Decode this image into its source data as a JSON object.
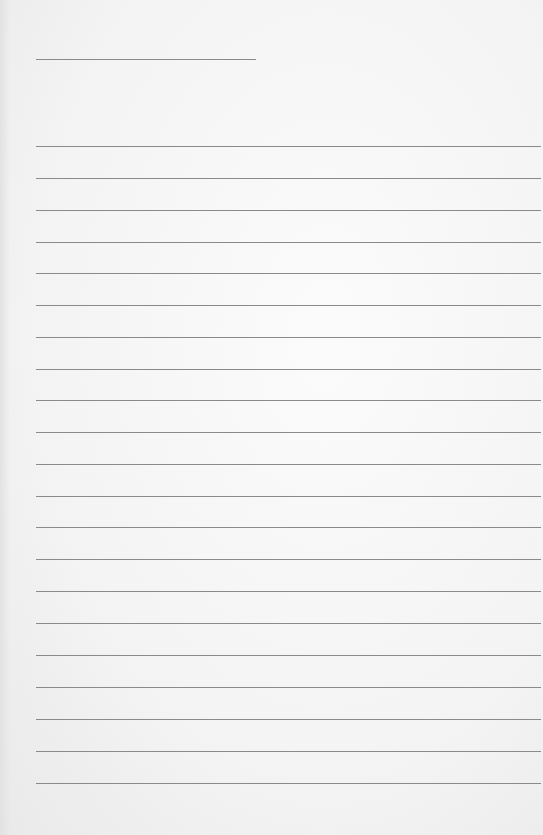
{
  "page": {
    "type": "blank-lined-paper",
    "title_line": {
      "top": 59,
      "left": 36,
      "width": 220
    },
    "lines": [
      146,
      178,
      210,
      242,
      273,
      305,
      337,
      369,
      400,
      432,
      464,
      496,
      527,
      559,
      591,
      623,
      655,
      687,
      719,
      751,
      783
    ],
    "line_color": "#8a8a8a",
    "paper_color": "#f4f4f4"
  }
}
